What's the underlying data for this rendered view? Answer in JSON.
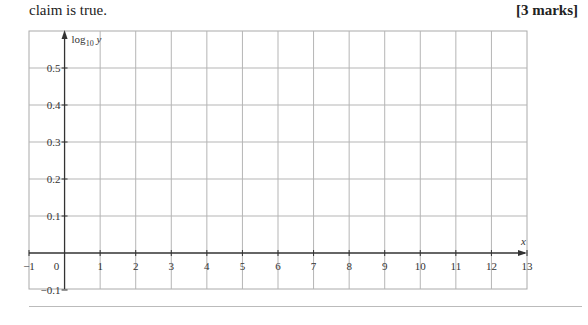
{
  "question": {
    "text": "claim is true.",
    "marks": "[3 marks]"
  },
  "chart_data": {
    "type": "line",
    "title": "",
    "xlabel": "x",
    "ylabel": "log10 y",
    "xlim": [
      -1,
      13
    ],
    "ylim": [
      -0.1,
      0.6
    ],
    "x_ticks": [
      "-1",
      "0",
      "1",
      "2",
      "3",
      "4",
      "5",
      "6",
      "7",
      "8",
      "9",
      "10",
      "11",
      "12",
      "13"
    ],
    "y_ticks": [
      "-0.1",
      "0.1",
      "0.2",
      "0.3",
      "0.4",
      "0.5"
    ],
    "grid": true,
    "series": []
  },
  "axis": {
    "y_label_main": "log",
    "y_label_sub": "10",
    "y_label_var": "y",
    "x_label": "x"
  }
}
